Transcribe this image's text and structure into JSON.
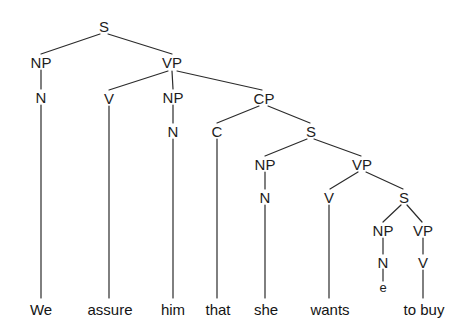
{
  "figure": {
    "kind": "syntax-tree",
    "sentence": "We assure him that she wants to buy",
    "width": 465,
    "height": 335,
    "background_color": "#ffffff",
    "line_color": "#2b2b2b",
    "text_color": "#1d1d1d"
  },
  "nodes": [
    {
      "id": "S1",
      "label": "S",
      "x": 104,
      "y": 26
    },
    {
      "id": "NP1",
      "label": "NP",
      "x": 41,
      "y": 62
    },
    {
      "id": "VP1",
      "label": "VP",
      "x": 172,
      "y": 62
    },
    {
      "id": "N1",
      "label": "N",
      "x": 41,
      "y": 97
    },
    {
      "id": "V1",
      "label": "V",
      "x": 109,
      "y": 98
    },
    {
      "id": "NP2",
      "label": "NP",
      "x": 173,
      "y": 97
    },
    {
      "id": "CP1",
      "label": "CP",
      "x": 264,
      "y": 98
    },
    {
      "id": "N2",
      "label": "N",
      "x": 173,
      "y": 131
    },
    {
      "id": "C1",
      "label": "C",
      "x": 217,
      "y": 131
    },
    {
      "id": "S2",
      "label": "S",
      "x": 311,
      "y": 131
    },
    {
      "id": "NP3",
      "label": "NP",
      "x": 265,
      "y": 164
    },
    {
      "id": "VP2",
      "label": "VP",
      "x": 362,
      "y": 164
    },
    {
      "id": "N3",
      "label": "N",
      "x": 265,
      "y": 197
    },
    {
      "id": "V2",
      "label": "V",
      "x": 329,
      "y": 197
    },
    {
      "id": "S3",
      "label": "S",
      "x": 404,
      "y": 197
    },
    {
      "id": "NP4",
      "label": "NP",
      "x": 383,
      "y": 230
    },
    {
      "id": "VP3",
      "label": "VP",
      "x": 423,
      "y": 230
    },
    {
      "id": "N4",
      "label": "N",
      "x": 383,
      "y": 262
    },
    {
      "id": "V3",
      "label": "V",
      "x": 423,
      "y": 262
    }
  ],
  "trace": {
    "id": "e1",
    "label": "e",
    "x": 383,
    "y": 287
  },
  "edges": [
    {
      "from": "S1",
      "to": "NP1",
      "x1": 100,
      "y1": 34,
      "x2": 41,
      "y2": 54
    },
    {
      "from": "S1",
      "to": "VP1",
      "x1": 108,
      "y1": 34,
      "x2": 172,
      "y2": 54
    },
    {
      "from": "NP1",
      "to": "N1",
      "x1": 41,
      "y1": 70,
      "x2": 41,
      "y2": 89
    },
    {
      "from": "VP1",
      "to": "V1",
      "x1": 168,
      "y1": 71,
      "x2": 109,
      "y2": 90
    },
    {
      "from": "VP1",
      "to": "NP2",
      "x1": 172,
      "y1": 71,
      "x2": 173,
      "y2": 89
    },
    {
      "from": "VP1",
      "to": "CP1",
      "x1": 177,
      "y1": 71,
      "x2": 262,
      "y2": 90
    },
    {
      "from": "NP2",
      "to": "N2",
      "x1": 173,
      "y1": 105,
      "x2": 173,
      "y2": 123
    },
    {
      "from": "CP1",
      "to": "C1",
      "x1": 259,
      "y1": 106,
      "x2": 217,
      "y2": 123
    },
    {
      "from": "CP1",
      "to": "S2",
      "x1": 268,
      "y1": 106,
      "x2": 310,
      "y2": 123
    },
    {
      "from": "S2",
      "to": "NP3",
      "x1": 307,
      "y1": 139,
      "x2": 265,
      "y2": 156
    },
    {
      "from": "S2",
      "to": "VP2",
      "x1": 314,
      "y1": 139,
      "x2": 361,
      "y2": 156
    },
    {
      "from": "NP3",
      "to": "N3",
      "x1": 265,
      "y1": 172,
      "x2": 265,
      "y2": 189
    },
    {
      "from": "VP2",
      "to": "V2",
      "x1": 358,
      "y1": 172,
      "x2": 330,
      "y2": 189
    },
    {
      "from": "VP2",
      "to": "S3",
      "x1": 366,
      "y1": 172,
      "x2": 403,
      "y2": 189
    },
    {
      "from": "S3",
      "to": "NP4",
      "x1": 401,
      "y1": 205,
      "x2": 383,
      "y2": 222
    },
    {
      "from": "S3",
      "to": "VP3",
      "x1": 407,
      "y1": 205,
      "x2": 422,
      "y2": 222
    },
    {
      "from": "NP4",
      "to": "N4",
      "x1": 383,
      "y1": 238,
      "x2": 383,
      "y2": 254
    },
    {
      "from": "VP3",
      "to": "V3",
      "x1": 423,
      "y1": 238,
      "x2": 423,
      "y2": 254
    },
    {
      "from": "N4",
      "to": "e1",
      "x1": 383,
      "y1": 269,
      "x2": 383,
      "y2": 281
    },
    {
      "from": "N1",
      "to": "We",
      "x1": 41,
      "y1": 105,
      "x2": 41,
      "y2": 298
    },
    {
      "from": "V1",
      "to": "assure",
      "x1": 109,
      "y1": 106,
      "x2": 109,
      "y2": 298
    },
    {
      "from": "N2",
      "to": "him",
      "x1": 173,
      "y1": 139,
      "x2": 173,
      "y2": 298
    },
    {
      "from": "C1",
      "to": "that",
      "x1": 217,
      "y1": 139,
      "x2": 217,
      "y2": 298
    },
    {
      "from": "N3",
      "to": "she",
      "x1": 265,
      "y1": 205,
      "x2": 265,
      "y2": 298
    },
    {
      "from": "V2",
      "to": "wants",
      "x1": 329,
      "y1": 205,
      "x2": 329,
      "y2": 298
    },
    {
      "from": "V3",
      "to": "to buy",
      "x1": 423,
      "y1": 270,
      "x2": 423,
      "y2": 298
    }
  ],
  "leaves": [
    {
      "id": "w1",
      "label": "We",
      "x": 41,
      "y": 309
    },
    {
      "id": "w2",
      "label": "assure",
      "x": 110,
      "y": 309
    },
    {
      "id": "w3",
      "label": "him",
      "x": 173,
      "y": 309
    },
    {
      "id": "w4",
      "label": "that",
      "x": 218,
      "y": 309
    },
    {
      "id": "w5",
      "label": "she",
      "x": 266,
      "y": 309
    },
    {
      "id": "w6",
      "label": "wants",
      "x": 330,
      "y": 309
    },
    {
      "id": "w7",
      "label": "to buy",
      "x": 424,
      "y": 309
    }
  ]
}
